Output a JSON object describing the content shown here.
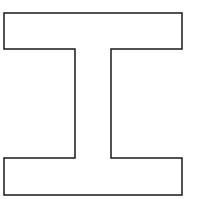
{
  "diagram": {
    "shape": "i-beam-cross-section",
    "stroke_color": "#1a1a1a",
    "fill_color": "#ffffff",
    "background": "#ffffff",
    "stroke_width": 1.5,
    "points": "4,13 182,13 182,49 111,49 111,158 182,158 182,195 4,195 4,158 75,158 75,49 4,49"
  }
}
